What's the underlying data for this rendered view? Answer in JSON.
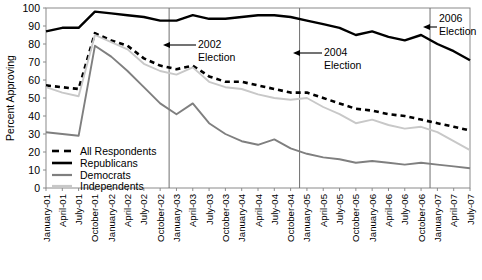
{
  "chart_data": {
    "type": "line",
    "title": "",
    "xlabel": "",
    "ylabel": "Percent Approving",
    "ylim": [
      0,
      100
    ],
    "ytick_values": [
      0,
      10,
      20,
      30,
      40,
      50,
      60,
      70,
      80,
      90,
      100
    ],
    "grid": false,
    "legend_position": "lower-left-inside",
    "x": [
      "January-01",
      "April-01",
      "July-01",
      "October-01",
      "January-02",
      "April-02",
      "July-02",
      "October-02",
      "January-03",
      "April-03",
      "July-03",
      "October-03",
      "January-04",
      "April-04",
      "July-04",
      "October-04",
      "January-05",
      "April-05",
      "July-05",
      "October-05",
      "January-06",
      "April-06",
      "July-06",
      "October-06",
      "January-07",
      "April-07",
      "July-07"
    ],
    "series": [
      {
        "name": "All Respondents",
        "color": "#000000",
        "style": "dashed",
        "values": [
          57,
          56,
          55,
          86,
          82,
          79,
          72,
          68,
          66,
          68,
          62,
          59,
          59,
          57,
          55,
          53,
          53,
          50,
          47,
          44,
          43,
          41,
          40,
          38,
          36,
          34,
          32
        ]
      },
      {
        "name": "Republicans",
        "color": "#000000",
        "style": "solid",
        "values": [
          87,
          89,
          89,
          98,
          97,
          96,
          95,
          93,
          93,
          96,
          94,
          94,
          95,
          96,
          96,
          95,
          93,
          91,
          89,
          85,
          87,
          84,
          82,
          85,
          80,
          76,
          71
        ]
      },
      {
        "name": "Democrats",
        "color": "#7f7f7f",
        "style": "solid",
        "values": [
          31,
          30,
          29,
          79,
          73,
          65,
          56,
          47,
          41,
          47,
          36,
          30,
          26,
          24,
          27,
          22,
          19,
          17,
          16,
          14,
          15,
          14,
          13,
          14,
          13,
          12,
          11
        ]
      },
      {
        "name": "Independents",
        "color": "#c8c8c8",
        "style": "solid",
        "values": [
          56,
          53,
          51,
          85,
          81,
          77,
          69,
          65,
          63,
          67,
          59,
          56,
          55,
          52,
          50,
          49,
          50,
          45,
          41,
          36,
          38,
          35,
          33,
          34,
          31,
          26,
          21
        ]
      }
    ],
    "annotations": [
      {
        "label_line1": "2002",
        "label_line2": "Election",
        "x_value": "November-02"
      },
      {
        "label_line1": "2004",
        "label_line2": "Election",
        "x_value": "November-04"
      },
      {
        "label_line1": "2006",
        "label_line2": "Election",
        "x_value": "November-06"
      }
    ],
    "legend_entries": [
      "All Respondents",
      "Republicans",
      "Democrats",
      "Independents"
    ]
  },
  "axis": {
    "y_ticks": [
      "100",
      "90",
      "80",
      "70",
      "60",
      "50",
      "40",
      "30",
      "20",
      "10",
      "0"
    ],
    "y_title": "Percent Approving"
  },
  "annotations": {
    "e2002_l1": "2002",
    "e2002_l2": "Election",
    "e2004_l1": "2004",
    "e2004_l2": "Election",
    "e2006_l1": "2006",
    "e2006_l2": "Election"
  },
  "legend": {
    "item0": "All Respondents",
    "item1": "Republicans",
    "item2": "Democrats",
    "item3": "Independents"
  },
  "xlabels": {
    "t0": "January-01",
    "t1": "April-01",
    "t2": "July-01",
    "t3": "October-01",
    "t4": "January-02",
    "t5": "April-02",
    "t6": "July-02",
    "t7": "October-02",
    "t8": "January-03",
    "t9": "April-03",
    "t10": "July-03",
    "t11": "October-03",
    "t12": "January-04",
    "t13": "April-04",
    "t14": "July-04",
    "t15": "October-04",
    "t16": "January-05",
    "t17": "April-05",
    "t18": "July-05",
    "t19": "October-05",
    "t20": "January-06",
    "t21": "April-06",
    "t22": "July-06",
    "t23": "October-06",
    "t24": "January-07",
    "t25": "April-07",
    "t26": "July-07"
  }
}
